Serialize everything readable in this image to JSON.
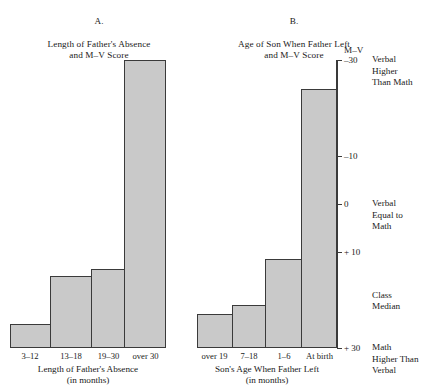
{
  "panel_a": {
    "title_letter": "A.",
    "title": "Length of Father's Absence\nand M–V Score",
    "axis_caption": "Length of Father's Absence\n(in months)",
    "categories": [
      "3–12",
      "13–18",
      "19–30",
      "over 30"
    ]
  },
  "panel_b": {
    "title_letter": "B.",
    "title": "Age of Son When Father Left\nand M–V Score",
    "axis_caption": "Son's Age When Father Left\n(in months)",
    "categories": [
      "over 19",
      "7–18",
      "1–6",
      "At birth"
    ]
  },
  "value_axis": {
    "header": "M–V",
    "ticks": [
      {
        "label": "–30",
        "value": -30
      },
      {
        "label": "–10",
        "value": -10
      },
      {
        "label": "0",
        "value": 0
      },
      {
        "label": "+ 10",
        "value": 10
      },
      {
        "label": "+ 30",
        "value": 30
      }
    ],
    "notes": [
      {
        "text": "Verbal\nHigher\nThan Math",
        "value": -30
      },
      {
        "text": "Verbal\nEqual to\nMath",
        "value": 0
      },
      {
        "text": "Class\nMedian",
        "value": 19
      },
      {
        "text": "Math\nHigher Than\nVerbal",
        "value": 30
      }
    ]
  },
  "style": {
    "bar_fill": "#c9c9c9",
    "bar_stroke": "#3a3a3a",
    "text_color": "#1a1a1a",
    "background": "#ffffff"
  },
  "chart_data": {
    "type": "bar",
    "ylabel": "M–V",
    "ylim": [
      -30,
      30
    ],
    "y_axis_inverted": true,
    "y_axis_position": "right",
    "grid": false,
    "legend": null,
    "panels": [
      {
        "id": "A",
        "title": "Length of Father's Absence and M–V Score",
        "xlabel": "Length of Father's Absence (in months)",
        "categories": [
          "3–12",
          "13–18",
          "19–30",
          "over 30"
        ],
        "values": [
          25,
          15,
          13.5,
          -30
        ],
        "bar_widths_rel": [
          40,
          42,
          33,
          41
        ]
      },
      {
        "id": "B",
        "title": "Age of Son When Father Left and M–V Score",
        "xlabel": "Son's Age When Father Left (in months)",
        "categories": [
          "over 19",
          "7–18",
          "1–6",
          "At birth"
        ],
        "values": [
          23,
          21,
          11.5,
          -24
        ],
        "bar_widths_rel": [
          35,
          34,
          36,
          35
        ]
      }
    ],
    "annotations": [
      {
        "at": -30,
        "text": "Verbal Higher Than Math"
      },
      {
        "at": 0,
        "text": "Verbal Equal to Math"
      },
      {
        "at": 19,
        "text": "Class Median"
      },
      {
        "at": 30,
        "text": "Math Higher Than Verbal"
      }
    ]
  }
}
